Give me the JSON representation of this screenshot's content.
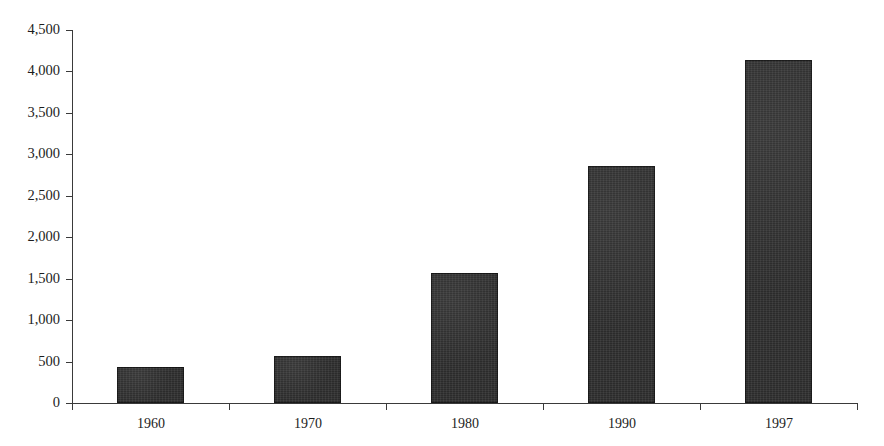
{
  "chart_data": {
    "type": "bar",
    "title": "",
    "xlabel": "",
    "ylabel": "",
    "categories": [
      "1960",
      "1970",
      "1980",
      "1990",
      "1997"
    ],
    "values": [
      435,
      565,
      1565,
      2860,
      4140
    ],
    "ylim": [
      0,
      4500
    ],
    "ytick_values": [
      0,
      500,
      1000,
      1500,
      2000,
      2500,
      3000,
      3500,
      4000,
      4500
    ],
    "ytick_labels": [
      "0",
      "500",
      "1,000",
      "1,500",
      "2,000",
      "2,500",
      "3,000",
      "3,500",
      "4,000",
      "4,500"
    ],
    "grid": false,
    "legend": false,
    "legend_position": "none",
    "bar_color": "#2b2b2b",
    "axis_color": "#3a3a3a",
    "background_color": "#ffffff"
  }
}
